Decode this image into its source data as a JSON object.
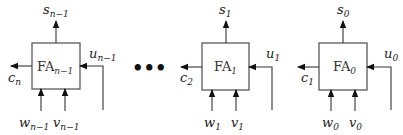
{
  "diagram": {
    "title": "",
    "type": "ripple-carry adder chain",
    "ellipsis": "•••",
    "adders": [
      {
        "id": "fa-n-1",
        "name": "FA",
        "index": "n−1",
        "sum_out": {
          "name": "s",
          "index": "n−1"
        },
        "carry_out": {
          "name": "c",
          "index": "n"
        },
        "carry_in": {
          "name": "u",
          "index": "n−1"
        },
        "inputs": [
          {
            "name": "w",
            "index": "n−1"
          },
          {
            "name": "v",
            "index": "n−1"
          }
        ]
      },
      {
        "id": "fa-1",
        "name": "FA",
        "index": "1",
        "sum_out": {
          "name": "s",
          "index": "1"
        },
        "carry_out": {
          "name": "c",
          "index": "2"
        },
        "carry_in": {
          "name": "u",
          "index": "1"
        },
        "inputs": [
          {
            "name": "w",
            "index": "1"
          },
          {
            "name": "v",
            "index": "1"
          }
        ]
      },
      {
        "id": "fa-0",
        "name": "FA",
        "index": "0",
        "sum_out": {
          "name": "s",
          "index": "0"
        },
        "carry_out": {
          "name": "c",
          "index": "1"
        },
        "carry_in": {
          "name": "u",
          "index": "0"
        },
        "inputs": [
          {
            "name": "w",
            "index": "0"
          },
          {
            "name": "v",
            "index": "0"
          }
        ]
      }
    ]
  }
}
